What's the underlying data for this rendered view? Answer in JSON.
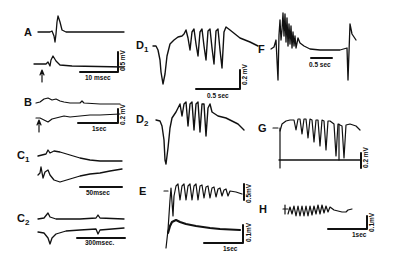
{
  "figure": {
    "panels": [
      {
        "id": "A",
        "label": "A",
        "time_scale": "10 msec",
        "amp_scale": "0.5 mV",
        "has_stimulus_arrow": true
      },
      {
        "id": "B",
        "label": "B",
        "time_scale": "1sec",
        "amp_scale": "0.2 mV",
        "has_stimulus_arrow": true
      },
      {
        "id": "C1",
        "label": "C",
        "subscript": "1",
        "time_scale": "50msec"
      },
      {
        "id": "C2",
        "label": "C",
        "subscript": "2",
        "time_scale": "300msec."
      },
      {
        "id": "D1",
        "label": "D",
        "subscript": "1",
        "time_scale": "0.5 sec",
        "amp_scale": "0.2 mV"
      },
      {
        "id": "D2",
        "label": "D",
        "subscript": "2"
      },
      {
        "id": "E",
        "label": "E",
        "time_scale": "1sec",
        "amp_scale_top": "0.5mV",
        "amp_scale_bottom": "0.1mV"
      },
      {
        "id": "F",
        "label": "F",
        "time_scale": "0.5 sec"
      },
      {
        "id": "G",
        "label": "G",
        "amp_scale": "0.2 mV"
      },
      {
        "id": "H",
        "label": "H",
        "time_scale": "1sec",
        "amp_scale": "0.1mV"
      }
    ]
  },
  "labels": {
    "A": "A",
    "B": "B",
    "C": "C",
    "C1_sub": "1",
    "C2_sub": "2",
    "D": "D",
    "D1_sub": "1",
    "D2_sub": "2",
    "E": "E",
    "F": "F",
    "G": "G",
    "H": "H"
  },
  "scales": {
    "A_time": "10 msec",
    "A_amp": "0.5 mV",
    "B_time": "1sec",
    "B_amp": "0.2 mV",
    "C1_time": "50msec",
    "C2_time": "300msec.",
    "D1_time": "0.5 sec",
    "D1_amp": "0.2 mV",
    "E_time": "1sec",
    "E_amp_top": "0.5mV",
    "E_amp_bottom": "0.1mV",
    "F_time": "0.5 sec",
    "G_amp": "0.2 mV",
    "H_time": "1sec",
    "H_amp": "0.1mV"
  }
}
